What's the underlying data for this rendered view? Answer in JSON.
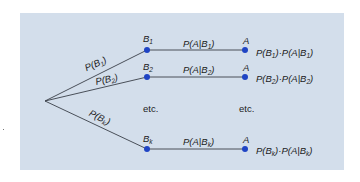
{
  "diagram": {
    "type": "probability-tree",
    "colors": {
      "panel_background": "#d3deeb",
      "node_fill": "#1f44c4",
      "edge_stroke": "#3a3f48",
      "text": "#1c1c1c"
    },
    "root": {
      "x": 45,
      "y": 101
    },
    "branches": [
      {
        "node_label": "B",
        "node_subscript": "1",
        "edge_label": "P(B",
        "edge_label_sub": "1",
        "edge_label_close": ")",
        "conditional_label": "P(A|B",
        "conditional_sub": "1",
        "conditional_close": ")",
        "outcome_label": "A",
        "product_p1": "P(B",
        "product_sub1": "1",
        "product_mid": ")·P(A|B",
        "product_sub2": "1",
        "product_close": ")"
      },
      {
        "node_label": "B",
        "node_subscript": "2",
        "edge_label": "P(B",
        "edge_label_sub": "2",
        "edge_label_close": ")",
        "conditional_label": "P(A|B",
        "conditional_sub": "2",
        "conditional_close": ")",
        "outcome_label": "A",
        "product_p1": "P(B",
        "product_sub1": "2",
        "product_mid": ")·P(A|B",
        "product_sub2": "2",
        "product_close": ")"
      },
      {
        "node_label": "B",
        "node_subscript": "k",
        "edge_label": "P(B",
        "edge_label_sub": "k",
        "edge_label_close": ")",
        "conditional_label": "P(A|B",
        "conditional_sub": "k",
        "conditional_close": ")",
        "outcome_label": "A",
        "product_p1": "P(B",
        "product_sub1": "k",
        "product_mid": ")·P(A|B",
        "product_sub2": "k",
        "product_close": ")"
      }
    ],
    "ellipsis": {
      "middle": "etc.",
      "right": "etc."
    }
  }
}
